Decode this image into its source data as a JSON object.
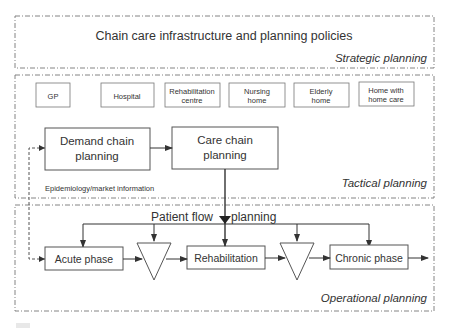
{
  "strategic": {
    "title": "Chain care infrastructure and planning policies",
    "label": "Strategic planning"
  },
  "tactical": {
    "label": "Tactical planning",
    "facilities": [
      {
        "line1": "GP",
        "line2": ""
      },
      {
        "line1": "Hospital",
        "line2": ""
      },
      {
        "line1": "Rehabilitation",
        "line2": "centre"
      },
      {
        "line1": "Nursing",
        "line2": "home"
      },
      {
        "line1": "Elderly",
        "line2": "home"
      },
      {
        "line1": "Home with",
        "line2": "home care"
      }
    ],
    "demand_chain": {
      "line1": "Demand chain",
      "line2": "planning"
    },
    "care_chain": {
      "line1": "Care chain",
      "line2": "planning"
    },
    "feedback_label": "Epidemiology/market information"
  },
  "operational": {
    "label": "Operational planning",
    "flow_title_left": "Patient flow",
    "flow_title_right": "planning",
    "phases": {
      "acute": "Acute phase",
      "rehab": "Rehabilitation",
      "chronic": "Chronic phase"
    }
  },
  "colors": {
    "line": "#333333",
    "panel_border": "#777777",
    "box_border": "#555555"
  }
}
